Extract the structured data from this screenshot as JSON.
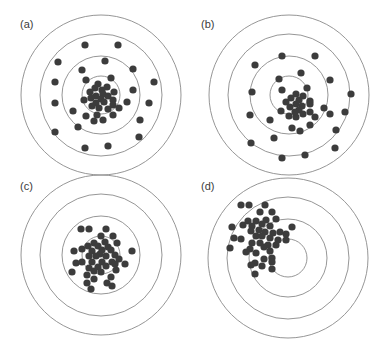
{
  "figure": {
    "colors": {
      "ring": "#8a8a8a",
      "dot": "#3c3c3c",
      "label": "#3a3a3a",
      "background": "#ffffff"
    },
    "ring_radii": [
      80,
      61,
      39,
      19
    ],
    "dot_radius": 3.6,
    "panels": [
      {
        "label": "(a)",
        "label_pos": [
          20,
          28
        ],
        "center": [
          101,
          95
        ],
        "interpretation": "accurate, imprecise",
        "dots": [
          [
            85,
            45
          ],
          [
            118,
            45
          ],
          [
            58,
            62
          ],
          [
            105,
            61
          ],
          [
            82,
            70
          ],
          [
            133,
            69
          ],
          [
            55,
            82
          ],
          [
            86,
            80
          ],
          [
            111,
            78
          ],
          [
            154,
            82
          ],
          [
            98,
            84
          ],
          [
            107,
            87
          ],
          [
            95,
            88
          ],
          [
            102,
            90
          ],
          [
            90,
            92
          ],
          [
            114,
            92
          ],
          [
            103,
            94
          ],
          [
            96,
            96
          ],
          [
            108,
            96
          ],
          [
            101,
            99
          ],
          [
            91,
            98
          ],
          [
            113,
            100
          ],
          [
            133,
            90
          ],
          [
            55,
            103
          ],
          [
            84,
            100
          ],
          [
            96,
            103
          ],
          [
            104,
            102
          ],
          [
            113,
            105
          ],
          [
            127,
            102
          ],
          [
            149,
            103
          ],
          [
            73,
            111
          ],
          [
            92,
            106
          ],
          [
            99,
            108
          ],
          [
            108,
            109
          ],
          [
            119,
            108
          ],
          [
            86,
            116
          ],
          [
            97,
            115
          ],
          [
            113,
            115
          ],
          [
            140,
            120
          ],
          [
            78,
            127
          ],
          [
            103,
            120
          ],
          [
            55,
            132
          ],
          [
            139,
            137
          ],
          [
            85,
            148
          ],
          [
            108,
            146
          ],
          [
            94,
            121
          ]
        ]
      },
      {
        "label": "(b)",
        "label_pos": [
          201,
          28
        ],
        "center": [
          289,
          95
        ],
        "interpretation": "inaccurate, imprecise",
        "dots": [
          [
            282,
            56
          ],
          [
            315,
            56
          ],
          [
            255,
            65
          ],
          [
            301,
            73
          ],
          [
            279,
            79
          ],
          [
            330,
            80
          ],
          [
            252,
            92
          ],
          [
            282,
            90
          ],
          [
            307,
            88
          ],
          [
            351,
            94
          ],
          [
            296,
            94
          ],
          [
            303,
            96
          ],
          [
            291,
            98
          ],
          [
            299,
            100
          ],
          [
            286,
            102
          ],
          [
            310,
            101
          ],
          [
            296,
            104
          ],
          [
            302,
            106
          ],
          [
            290,
            107
          ],
          [
            299,
            110
          ],
          [
            281,
            111
          ],
          [
            310,
            112
          ],
          [
            324,
            108
          ],
          [
            250,
            115
          ],
          [
            289,
            116
          ],
          [
            296,
            117
          ],
          [
            303,
            114
          ],
          [
            315,
            117
          ],
          [
            330,
            114
          ],
          [
            345,
            112
          ],
          [
            270,
            120
          ],
          [
            292,
            128
          ],
          [
            300,
            131
          ],
          [
            310,
            125
          ],
          [
            274,
            138
          ],
          [
            251,
            143
          ],
          [
            336,
            130
          ],
          [
            335,
            148
          ],
          [
            282,
            158
          ],
          [
            305,
            155
          ],
          [
            310,
            104
          ],
          [
            295,
            112
          ]
        ]
      },
      {
        "label": "(c)",
        "label_pos": [
          20,
          190
        ],
        "center": [
          101,
          255
        ],
        "interpretation": "accurate, precise",
        "dots": [
          [
            81,
            229
          ],
          [
            89,
            229
          ],
          [
            106,
            229
          ],
          [
            101,
            236
          ],
          [
            113,
            236
          ],
          [
            94,
            243
          ],
          [
            105,
            242
          ],
          [
            117,
            243
          ],
          [
            82,
            249
          ],
          [
            88,
            246
          ],
          [
            98,
            246
          ],
          [
            108,
            247
          ],
          [
            74,
            251
          ],
          [
            92,
            251
          ],
          [
            102,
            250
          ],
          [
            111,
            250
          ],
          [
            132,
            251
          ],
          [
            100,
            254
          ],
          [
            96,
            256
          ],
          [
            106,
            256
          ],
          [
            89,
            256
          ],
          [
            115,
            255
          ],
          [
            119,
            259
          ],
          [
            76,
            263
          ],
          [
            82,
            262
          ],
          [
            92,
            262
          ],
          [
            102,
            262
          ],
          [
            112,
            262
          ],
          [
            125,
            264
          ],
          [
            98,
            267
          ],
          [
            106,
            266
          ],
          [
            116,
            270
          ],
          [
            89,
            268
          ],
          [
            94,
            271
          ],
          [
            72,
            272
          ],
          [
            87,
            275
          ],
          [
            101,
            272
          ],
          [
            111,
            277
          ],
          [
            94,
            279
          ],
          [
            107,
            283
          ],
          [
            112,
            286
          ],
          [
            91,
            289
          ],
          [
            87,
            283
          ],
          [
            115,
            264
          ]
        ]
      },
      {
        "label": "(d)",
        "label_pos": [
          201,
          190
        ],
        "center": [
          288,
          258
        ],
        "interpretation": "inaccurate, precise",
        "dots": [
          [
            241,
            205
          ],
          [
            249,
            205
          ],
          [
            265,
            205
          ],
          [
            260,
            212
          ],
          [
            272,
            212
          ],
          [
            248,
            221
          ],
          [
            256,
            221
          ],
          [
            266,
            220
          ],
          [
            276,
            219
          ],
          [
            232,
            227
          ],
          [
            243,
            225
          ],
          [
            252,
            226
          ],
          [
            262,
            224
          ],
          [
            270,
            226
          ],
          [
            251,
            231
          ],
          [
            259,
            230
          ],
          [
            265,
            232
          ],
          [
            273,
            233
          ],
          [
            280,
            232
          ],
          [
            292,
            227
          ],
          [
            234,
            238
          ],
          [
            241,
            239
          ],
          [
            256,
            236
          ],
          [
            262,
            236
          ],
          [
            270,
            238
          ],
          [
            278,
            240
          ],
          [
            286,
            240
          ],
          [
            286,
            234
          ],
          [
            252,
            243
          ],
          [
            260,
            243
          ],
          [
            268,
            245
          ],
          [
            276,
            245
          ],
          [
            230,
            248
          ],
          [
            250,
            249
          ],
          [
            264,
            247
          ],
          [
            246,
            252
          ],
          [
            256,
            253
          ],
          [
            270,
            251
          ],
          [
            255,
            263
          ],
          [
            264,
            259
          ],
          [
            272,
            258
          ],
          [
            251,
            265
          ],
          [
            262,
            266
          ],
          [
            272,
            262
          ],
          [
            255,
            274
          ],
          [
            272,
            269
          ]
        ]
      }
    ]
  }
}
